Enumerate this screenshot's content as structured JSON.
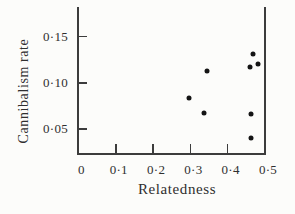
{
  "colors": {
    "background": "#fcfcfa",
    "axis": "#3c3c3c",
    "text": "#2f2f2f",
    "marker": "#141414"
  },
  "chart_data": {
    "type": "scatter",
    "title": "",
    "xlabel": "Relatedness",
    "ylabel": "Cannibalism rate",
    "xlim": [
      0,
      0.5
    ],
    "ylim": [
      0.0235,
      0.181
    ],
    "grid": false,
    "legend": null,
    "frame": {
      "left": true,
      "bottom": true,
      "right": true,
      "top": false
    },
    "tick_direction": "in",
    "decimal_separator": "middle-dot",
    "x_ticks": [
      {
        "value": 0.0,
        "label": "0"
      },
      {
        "value": 0.1,
        "label": "0·1"
      },
      {
        "value": 0.2,
        "label": "0·2"
      },
      {
        "value": 0.3,
        "label": "0·3"
      },
      {
        "value": 0.4,
        "label": "0·4"
      },
      {
        "value": 0.5,
        "label": "0·5"
      }
    ],
    "y_ticks": [
      {
        "value": 0.05,
        "label": "0·05"
      },
      {
        "value": 0.1,
        "label": "0·10"
      },
      {
        "value": 0.15,
        "label": "0·15"
      }
    ],
    "marker": {
      "shape": "circle",
      "size_px": 5
    },
    "points": [
      {
        "x": 0.295,
        "y": 0.084
      },
      {
        "x": 0.337,
        "y": 0.067
      },
      {
        "x": 0.345,
        "y": 0.113
      },
      {
        "x": 0.459,
        "y": 0.117
      },
      {
        "x": 0.463,
        "y": 0.04
      },
      {
        "x": 0.463,
        "y": 0.066
      },
      {
        "x": 0.468,
        "y": 0.131
      },
      {
        "x": 0.48,
        "y": 0.12
      }
    ]
  }
}
